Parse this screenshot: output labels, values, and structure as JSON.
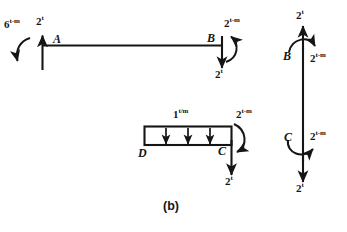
{
  "figure": {
    "caption": "(b)",
    "type": "structural-free-body-diagram",
    "stroke_color": "#151515",
    "background_color": "#ffffff"
  },
  "member_ab": {
    "name": "horizontal-beam-AB",
    "node_left": "A",
    "node_right": "B",
    "moment_left": "6",
    "moment_left_unit": "t-m",
    "force_left": "2",
    "force_left_unit": "t",
    "force_left_direction": "up",
    "moment_right": "2",
    "moment_right_unit": "t-m",
    "force_right": "2",
    "force_right_unit": "t",
    "force_right_direction": "down"
  },
  "member_dc": {
    "name": "horizontal-beam-DC",
    "node_left": "D",
    "node_right": "C",
    "distributed_load": "1",
    "distributed_load_unit": "t/m",
    "distributed_arrow_count": 3,
    "moment_right": "2",
    "moment_right_unit": "t-m",
    "force_right": "2",
    "force_right_unit": "t",
    "force_right_direction": "down"
  },
  "member_bc": {
    "name": "vertical-column-BC",
    "node_top": "B",
    "node_bottom": "C",
    "force_top": "2",
    "force_top_unit": "t",
    "force_top_direction": "up",
    "moment_top": "2",
    "moment_top_unit": "t-m",
    "force_bottom": "2",
    "force_bottom_unit": "t",
    "force_bottom_direction": "down",
    "moment_bottom": "2",
    "moment_bottom_unit": "t-m"
  }
}
